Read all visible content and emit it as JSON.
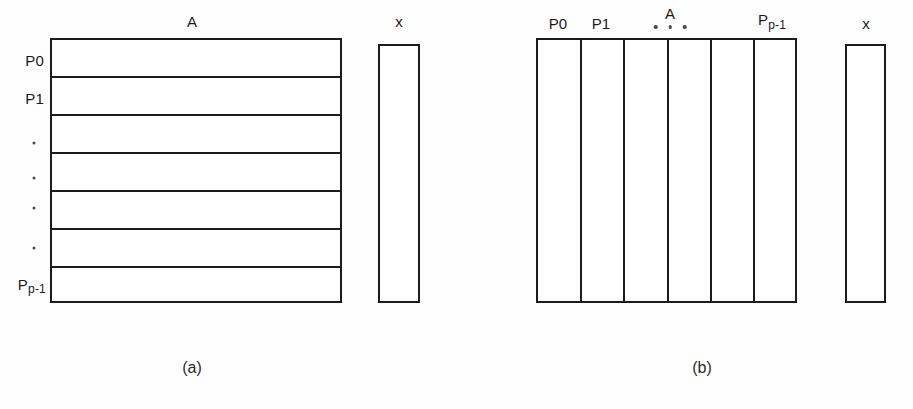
{
  "figure": {
    "background_color": "#fefefe",
    "line_color": "#1c1c1c",
    "text_color": "#1a1a1a"
  },
  "panel_a": {
    "caption": "(a)",
    "matrix_label": "A",
    "vector_label": "x",
    "row_labels": [
      {
        "text": "P0",
        "sub": ""
      },
      {
        "text": "P1",
        "sub": ""
      },
      {
        "text": "P",
        "sub": "p-1"
      }
    ],
    "vertical_ellipsis_dots": 4,
    "row_count": 7,
    "partition_direction": "row-wise"
  },
  "panel_b": {
    "caption": "(b)",
    "matrix_label": "A",
    "vector_label": "x",
    "column_labels": [
      {
        "text": "P0",
        "sub": ""
      },
      {
        "text": "P1",
        "sub": ""
      },
      {
        "text": "P",
        "sub": "p-1"
      }
    ],
    "horizontal_ellipsis_dots": 3,
    "column_count": 6,
    "partition_direction": "column-wise"
  }
}
